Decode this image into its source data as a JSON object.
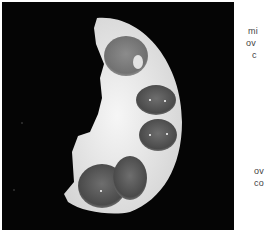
{
  "figure": {
    "image_alt": "Cut surface of a half-round specimen with multiple dark cystic chambers on a black background",
    "background_color": "#050505",
    "specimen_color": "#e8e8e8",
    "cyst_color": "#5a5a5a"
  },
  "captions": {
    "top": [
      "mi",
      "ov",
      "c"
    ],
    "bottom": [
      "ov",
      "co"
    ]
  }
}
